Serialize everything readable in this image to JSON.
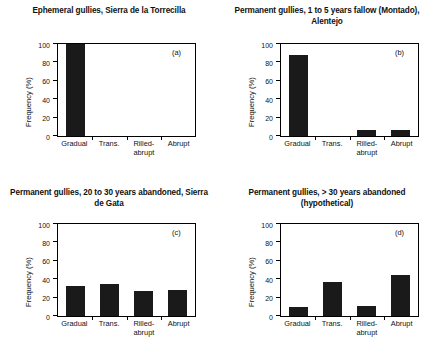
{
  "figure": {
    "ylabel": "Frequency (%)",
    "yticks": [
      "0",
      "20",
      "40",
      "60",
      "80",
      "100"
    ],
    "categories": [
      "Gradual",
      "Trans.",
      "Rilled-\nabrupt",
      "Abrupt"
    ],
    "bar_color": "#1a1a1a"
  },
  "panels": [
    {
      "tag": "(a)",
      "title": "Ephemeral gullies, Sierra de la Torrecilla",
      "values": [
        100,
        0,
        0,
        0
      ]
    },
    {
      "tag": "(b)",
      "title": "Permanent gullies, 1 to 5 years fallow (Montado), Alentejo",
      "values": [
        88,
        0,
        7,
        7
      ]
    },
    {
      "tag": "(c)",
      "title": "Permanent gullies, 20 to 30 years abandoned, Sierra de Gata",
      "values": [
        33,
        35,
        27,
        28
      ]
    },
    {
      "tag": "(d)",
      "title": "Permanent gullies, > 30 years abandoned (hypothetical)",
      "values": [
        10,
        37,
        11,
        45
      ]
    }
  ],
  "chart_data": {
    "type": "bar",
    "xlabel": "",
    "ylabel": "Frequency (%)",
    "ylim": [
      0,
      100
    ],
    "yticks": [
      0,
      20,
      40,
      60,
      80,
      100
    ],
    "grid": false,
    "legend": "none",
    "categories": [
      "Gradual",
      "Trans.",
      "Rilled-abrupt",
      "Abrupt"
    ],
    "panels": [
      {
        "panel": "(a)",
        "title": "Ephemeral gullies, Sierra de la Torrecilla",
        "values": [
          100,
          0,
          0,
          0
        ]
      },
      {
        "panel": "(b)",
        "title": "Permanent gullies, 1 to 5 years fallow (Montado), Alentejo",
        "values": [
          88,
          0,
          7,
          7
        ]
      },
      {
        "panel": "(c)",
        "title": "Permanent gullies, 20 to 30 years abandoned, Sierra de Gata",
        "values": [
          33,
          35,
          27,
          28
        ]
      },
      {
        "panel": "(d)",
        "title": "Permanent gullies, > 30 years abandoned (hypothetical)",
        "values": [
          10,
          37,
          11,
          45
        ]
      }
    ]
  }
}
